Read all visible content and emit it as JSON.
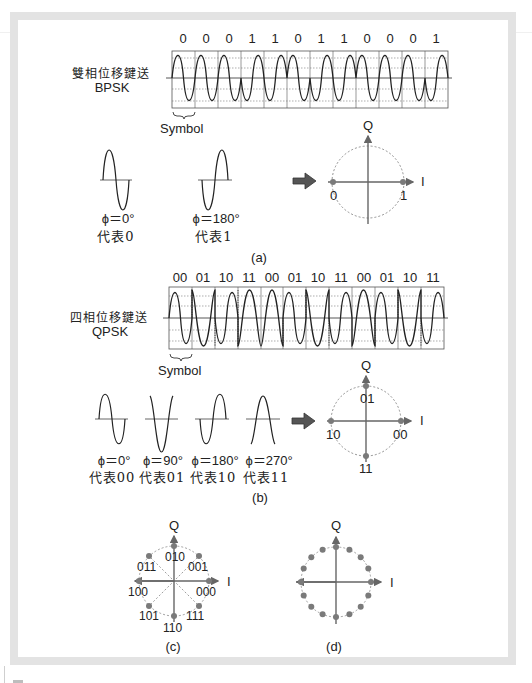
{
  "bpsk": {
    "title_cjk": "雙相位移鍵送",
    "title": "BPSK",
    "bits": [
      "0",
      "0",
      "0",
      "1",
      "1",
      "0",
      "1",
      "1",
      "0",
      "0",
      "0",
      "1"
    ],
    "symbol_label": "Symbol",
    "phases": [
      {
        "phase": "ϕ＝0°",
        "meaning": "代表0"
      },
      {
        "phase": "ϕ＝180°",
        "meaning": "代表1"
      }
    ],
    "constellation": {
      "q_label": "Q",
      "i_label": "I",
      "points": [
        {
          "label": "0"
        },
        {
          "label": "1"
        }
      ]
    },
    "caption": "(a)"
  },
  "qpsk": {
    "title_cjk": "四相位移鍵送",
    "title": "QPSK",
    "bits": [
      "00",
      "01",
      "10",
      "11",
      "00",
      "01",
      "10",
      "11",
      "00",
      "01",
      "10",
      "11"
    ],
    "symbol_label": "Symbol",
    "phases": [
      {
        "phase": "ϕ＝0°",
        "meaning": "代表00"
      },
      {
        "phase": "ϕ＝90°",
        "meaning": "代表01"
      },
      {
        "phase": "ϕ＝180°",
        "meaning": "代表10"
      },
      {
        "phase": "ϕ＝270°",
        "meaning": "代表11"
      }
    ],
    "constellation": {
      "q_label": "Q",
      "i_label": "I",
      "points": [
        {
          "label": "00"
        },
        {
          "label": "01"
        },
        {
          "label": "10"
        },
        {
          "label": "11"
        }
      ]
    },
    "caption": "(b)"
  },
  "psk8": {
    "q_label": "Q",
    "i_label": "I",
    "points": [
      "000",
      "001",
      "010",
      "011",
      "100",
      "101",
      "110",
      "111"
    ],
    "caption": "(c)"
  },
  "psk16": {
    "q_label": "Q",
    "i_label": "I",
    "point_count": 16,
    "caption": "(d)"
  },
  "colors": {
    "frame": "#e3e3e3",
    "wave": "#222222",
    "grid": "#555555",
    "axis": "#666666",
    "point": "#7a7a7a",
    "arrow": "#555555"
  }
}
